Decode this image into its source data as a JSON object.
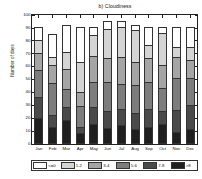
{
  "chart_data": {
    "type": "bar",
    "subtype": "stacked-bar",
    "title": "b) Cloudiness",
    "xlabel": "",
    "ylabel": "Number of days",
    "ylim": [
      0,
      100
    ],
    "yticks": [
      0,
      10,
      20,
      30,
      40,
      50,
      60,
      70,
      80,
      90,
      100
    ],
    "ytick_labels": [
      "0",
      "10",
      "20",
      "30",
      "40",
      "50",
      "60",
      "70",
      "80",
      "90",
      "100"
    ],
    "grid": false,
    "legend_position": "below",
    "categories": [
      "Jan",
      "Feb",
      "Mar",
      "Apr",
      "May",
      "Jun",
      "Jul",
      "Aug",
      "Sep",
      "Oct",
      "Nov",
      "Dec"
    ],
    "series": [
      {
        "name": ">8",
        "color": "#1f1f1f",
        "values": [
          20,
          13,
          18,
          8,
          15,
          12,
          14,
          11,
          13,
          15,
          9,
          11
        ]
      },
      {
        "name": "7-8",
        "color": "#4a4a4a",
        "values": [
          16,
          9,
          10,
          5,
          13,
          13,
          13,
          13,
          14,
          10,
          17,
          19
        ]
      },
      {
        "name": "5-6",
        "color": "#7d7d7d",
        "values": [
          21,
          25,
          14,
          16,
          20,
          23,
          19,
          21,
          21,
          18,
          25,
          21
        ]
      },
      {
        "name": "3-4",
        "color": "#a5a5a5",
        "values": [
          13,
          14,
          16,
          11,
          20,
          18,
          21,
          18,
          18,
          18,
          16,
          14
        ]
      },
      {
        "name": "1-2",
        "color": "#d4d4d4",
        "values": [
          10,
          6,
          13,
          23,
          16,
          23,
          23,
          25,
          10,
          25,
          8,
          10
        ]
      },
      {
        "name": "<=0",
        "color": "#ffffff",
        "values": [
          11,
          18,
          21,
          28,
          7,
          6,
          5,
          4,
          15,
          5,
          16,
          16
        ]
      }
    ]
  },
  "legend": {
    "items": [
      {
        "label": "<=0",
        "color": "#ffffff"
      },
      {
        "label": "1-2",
        "color": "#d4d4d4"
      },
      {
        "label": "3-4",
        "color": "#a5a5a5"
      },
      {
        "label": "5-6",
        "color": "#7d7d7d"
      },
      {
        "label": "7-8",
        "color": "#4a4a4a"
      },
      {
        "label": ">8",
        "color": "#1f1f1f"
      }
    ]
  },
  "colors": {
    "axis": "#222222",
    "text": "#111111",
    "background": "#ffffff"
  }
}
